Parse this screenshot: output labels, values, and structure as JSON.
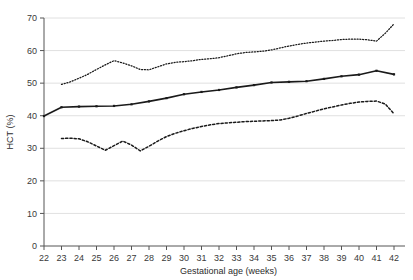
{
  "chart_data": {
    "type": "line",
    "title": "",
    "xlabel": "Gestational age (weeks)",
    "ylabel": "HCT (%)",
    "xlim": [
      22,
      42.6
    ],
    "ylim": [
      0,
      70
    ],
    "xticks": [
      22,
      23,
      24,
      25,
      26,
      27,
      28,
      29,
      30,
      31,
      32,
      33,
      34,
      35,
      36,
      37,
      38,
      39,
      40,
      41,
      42
    ],
    "yticks": [
      0,
      10,
      20,
      30,
      40,
      50,
      60,
      70
    ],
    "grid": "horizontal",
    "legend": "none",
    "series": [
      {
        "name": "upper-percentile",
        "style": "fine-dotted",
        "color": "#1a1a1a",
        "x": [
          23,
          23.5,
          24,
          24.5,
          25,
          25.5,
          26,
          26.5,
          27,
          27.5,
          28,
          28.5,
          29,
          29.5,
          30,
          30.5,
          31,
          31.5,
          32,
          32.5,
          33,
          33.5,
          34,
          34.5,
          35,
          35.5,
          36,
          36.5,
          37,
          37.5,
          38,
          38.5,
          39,
          39.5,
          40,
          40.5,
          41,
          41.5,
          42
        ],
        "values": [
          49.6,
          50.4,
          51.5,
          52.7,
          54.2,
          55.6,
          56.9,
          56.2,
          55.3,
          54.2,
          54.1,
          55.0,
          55.9,
          56.4,
          56.6,
          56.9,
          57.3,
          57.5,
          57.8,
          58.4,
          59.0,
          59.4,
          59.6,
          59.8,
          60.2,
          60.8,
          61.4,
          61.9,
          62.3,
          62.6,
          62.9,
          63.1,
          63.4,
          63.5,
          63.5,
          63.3,
          62.9,
          65.3,
          68.2
        ]
      },
      {
        "name": "median",
        "style": "solid",
        "color": "#1a1a1a",
        "x": [
          22,
          23,
          24,
          25,
          26,
          27,
          28,
          29,
          30,
          31,
          32,
          33,
          34,
          35,
          36,
          37,
          38,
          39,
          40,
          41,
          42
        ],
        "values": [
          39.9,
          42.6,
          42.8,
          42.9,
          43.0,
          43.5,
          44.4,
          45.4,
          46.6,
          47.3,
          47.9,
          48.7,
          49.4,
          50.2,
          50.4,
          50.6,
          51.3,
          52.1,
          52.6,
          53.8,
          52.7
        ]
      },
      {
        "name": "lower-percentile",
        "style": "dashed",
        "color": "#1a1a1a",
        "x": [
          23,
          23.5,
          24,
          24.5,
          25,
          25.5,
          26,
          26.5,
          27,
          27.5,
          28,
          28.5,
          29,
          29.5,
          30,
          30.5,
          31,
          31.5,
          32,
          32.5,
          33,
          33.5,
          34,
          34.5,
          35,
          35.5,
          36,
          36.5,
          37,
          37.5,
          38,
          38.5,
          39,
          39.5,
          40,
          40.5,
          41,
          41.5,
          42
        ],
        "values": [
          33.0,
          33.1,
          32.9,
          32.0,
          30.7,
          29.4,
          30.8,
          32.2,
          31.0,
          29.2,
          30.6,
          32.2,
          33.6,
          34.6,
          35.4,
          36.1,
          36.7,
          37.2,
          37.6,
          37.8,
          38.0,
          38.2,
          38.3,
          38.4,
          38.5,
          38.7,
          39.2,
          39.9,
          40.7,
          41.4,
          42.1,
          42.7,
          43.3,
          43.8,
          44.2,
          44.4,
          44.5,
          43.6,
          40.6
        ]
      }
    ]
  },
  "axes": {
    "x_title": "Gestational age (weeks)",
    "y_title": "HCT (%)",
    "x_tick_labels": [
      "22",
      "23",
      "24",
      "25",
      "26",
      "27",
      "28",
      "29",
      "30",
      "31",
      "32",
      "33",
      "34",
      "35",
      "36",
      "37",
      "38",
      "39",
      "40",
      "41",
      "42"
    ],
    "y_tick_labels": [
      "0",
      "10",
      "20",
      "30",
      "40",
      "50",
      "60",
      "70"
    ]
  },
  "colors": {
    "line": "#1a1a1a",
    "grid": "#d8d8d8",
    "axis": "#555555",
    "text": "#3a3a3a",
    "background": "#ffffff"
  }
}
